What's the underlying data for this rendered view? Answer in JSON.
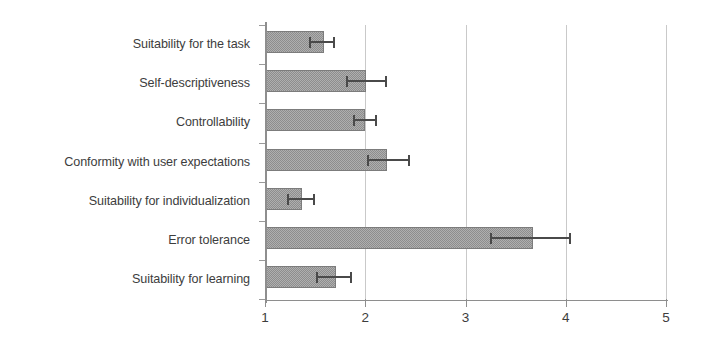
{
  "chart_data": {
    "type": "bar",
    "orientation": "horizontal",
    "title": "",
    "subtitle": "",
    "xlabel": "",
    "ylabel": "",
    "xlim": [
      1,
      5
    ],
    "ylim": null,
    "grid": true,
    "gridlines_x": [
      2,
      3,
      4,
      5
    ],
    "legend": null,
    "legend_position": "none",
    "xticks": [
      1,
      2,
      3,
      4,
      5
    ],
    "xtick_labels": [
      "1",
      "2",
      "3",
      "4",
      "5"
    ],
    "categories": [
      "Suitability for the task",
      "Self-descriptiveness",
      "Controllability",
      "Conformity with user expectations",
      "Suitability for individualization",
      "Error tolerance",
      "Suitability for learning"
    ],
    "values": [
      1.59,
      2.01,
      2.0,
      2.22,
      1.37,
      3.67,
      1.71
    ],
    "error_low": [
      1.45,
      1.82,
      1.89,
      2.03,
      1.23,
      3.25,
      1.52
    ],
    "error_high": [
      1.69,
      2.21,
      2.11,
      2.44,
      1.49,
      4.04,
      1.86
    ],
    "series": [
      {
        "name": "Mean rating",
        "values": [
          1.59,
          2.01,
          2.0,
          2.22,
          1.37,
          3.67,
          1.71
        ]
      }
    ],
    "bar_color": "#8d8d8d",
    "error_color": "#4a4a4a",
    "grid_color": "#c9c9c9",
    "axis_color": "#8e8e8e",
    "background": "#ffffff"
  }
}
